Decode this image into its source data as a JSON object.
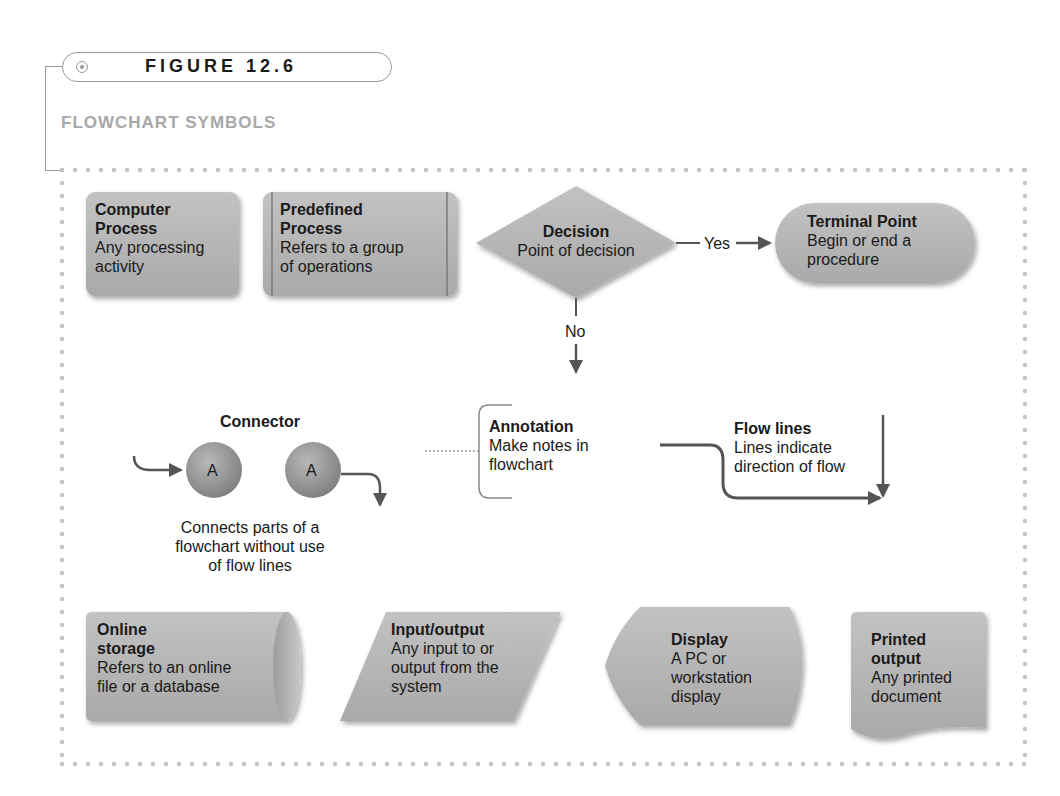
{
  "figure": {
    "label": "FIGURE 12.6",
    "title": "FLOWCHART SYMBOLS"
  },
  "colors": {
    "shape_fill": "#b3b3b3",
    "shape_shadow": "#8c8c8c",
    "frame_dots": "#c4c4c4",
    "subtitle": "#a8a8a8",
    "arrow": "#555555"
  },
  "symbols": {
    "computer_process": {
      "title_line1": "Computer",
      "title_line2": "Process",
      "desc_line1": "Any processing",
      "desc_line2": "activity"
    },
    "predefined_process": {
      "title_line1": "Predefined",
      "title_line2": "Process",
      "desc_line1": "Refers to a group",
      "desc_line2": "of operations"
    },
    "decision": {
      "title": "Decision",
      "desc": "Point of decision",
      "yes_label": "Yes",
      "no_label": "No"
    },
    "terminal_point": {
      "title": "Terminal Point",
      "desc_line1": "Begin or end a",
      "desc_line2": "procedure"
    },
    "connector": {
      "title": "Connector",
      "circle_letter_1": "A",
      "circle_letter_2": "A",
      "desc_line1": "Connects parts of a",
      "desc_line2": "flowchart without use",
      "desc_line3": "of flow lines"
    },
    "annotation": {
      "title": "Annotation",
      "desc_line1": "Make notes in",
      "desc_line2": "flowchart"
    },
    "flow_lines": {
      "title": "Flow lines",
      "desc_line1": "Lines indicate",
      "desc_line2": "direction of flow"
    },
    "online_storage": {
      "title_line1": "Online",
      "title_line2": "storage",
      "desc_line1": "Refers to an online",
      "desc_line2": "file or a database"
    },
    "input_output": {
      "title": "Input/output",
      "desc_line1": "Any input to or",
      "desc_line2": "output from the",
      "desc_line3": "system"
    },
    "display": {
      "title": "Display",
      "desc_line1": "A PC or",
      "desc_line2": "workstation",
      "desc_line3": "display"
    },
    "printed_output": {
      "title_line1": "Printed",
      "title_line2": "output",
      "desc_line1": "Any printed",
      "desc_line2": "document"
    }
  }
}
